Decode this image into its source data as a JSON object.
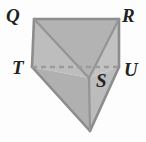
{
  "figure": {
    "name": "prism-net-diagram",
    "background_color": "#fdfdfd",
    "outline_color": "#8c8c8c",
    "hidden_edge_color": "#9b9b9b",
    "labels": [
      {
        "id": "Q",
        "text": "Q",
        "x": 6,
        "y": 6
      },
      {
        "id": "R",
        "text": "R",
        "x": 122,
        "y": 6
      },
      {
        "id": "T",
        "text": "T",
        "x": 12,
        "y": 58
      },
      {
        "id": "U",
        "text": "U",
        "x": 124,
        "y": 60
      },
      {
        "id": "S",
        "text": "S",
        "x": 96,
        "y": 71
      }
    ],
    "vertices": {
      "Q": {
        "x": 34,
        "y": 19
      },
      "R": {
        "x": 119,
        "y": 19
      },
      "T": {
        "x": 32,
        "y": 67
      },
      "U": {
        "x": 119,
        "y": 67
      },
      "S": {
        "x": 89,
        "y": 78
      },
      "B": {
        "x": 90,
        "y": 131
      }
    },
    "faces": [
      {
        "id": "face-QTS",
        "points": "34,19 32,67 89,78",
        "fill": "#bdbdbd"
      },
      {
        "id": "face-QSR",
        "points": "34,19 89,78 119,19",
        "fill": "#b3b3b3"
      },
      {
        "id": "face-SRU",
        "points": "89,78 119,19 119,67",
        "fill": "#c2c2c2"
      },
      {
        "id": "face-TSB",
        "points": "32,67 89,78 90,131",
        "fill": "#b0b0b0"
      },
      {
        "id": "face-SUB",
        "points": "89,78 119,67 90,131",
        "fill": "#bcbcbc"
      }
    ],
    "edges": [
      {
        "id": "edge-QR",
        "from": "Q",
        "to": "R",
        "style": "solid"
      },
      {
        "id": "edge-QT",
        "from": "Q",
        "to": "T",
        "style": "solid"
      },
      {
        "id": "edge-RU",
        "from": "R",
        "to": "U",
        "style": "solid"
      },
      {
        "id": "edge-TU",
        "from": "T",
        "to": "U",
        "style": "dashed"
      },
      {
        "id": "edge-QS",
        "from": "Q",
        "to": "S",
        "style": "solid"
      },
      {
        "id": "edge-RS",
        "from": "R",
        "to": "S",
        "style": "solid"
      },
      {
        "id": "edge-TB",
        "from": "T",
        "to": "B",
        "style": "solid"
      },
      {
        "id": "edge-UB",
        "from": "U",
        "to": "B",
        "style": "solid"
      },
      {
        "id": "edge-SB",
        "from": "S",
        "to": "B",
        "style": "solid"
      }
    ]
  }
}
